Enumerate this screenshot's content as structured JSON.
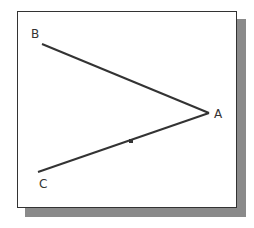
{
  "diagram": {
    "type": "angle",
    "points": {
      "A": {
        "label": "A",
        "x": 209,
        "y": 113
      },
      "B": {
        "label": "B",
        "x": 42,
        "y": 44
      },
      "C": {
        "label": "C",
        "x": 38,
        "y": 172
      }
    },
    "segments": [
      [
        "B",
        "A"
      ],
      [
        "C",
        "A"
      ]
    ],
    "marker": {
      "x": 131,
      "y": 141
    },
    "colors": {
      "line": "#333333",
      "frame": "#333333",
      "shadow": "#8a8a8a"
    }
  }
}
